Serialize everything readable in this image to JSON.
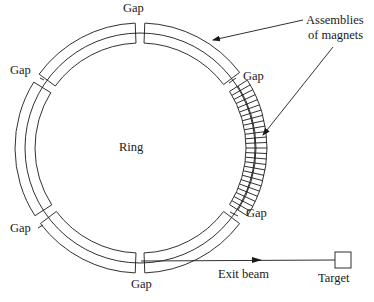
{
  "diagram": {
    "ring_label": "Ring",
    "gap_labels": [
      "Gap",
      "Gap",
      "Gap",
      "Gap",
      "Gap",
      "Gap"
    ],
    "assemblies_label_line1": "Assemblies",
    "assemblies_label_line2": "of magnets",
    "exit_beam_label": "Exit beam",
    "target_label": "Target",
    "colors": {
      "line": "#1a1a1a",
      "background": "#ffffff"
    },
    "geometry": {
      "center": [
        140,
        148
      ],
      "r_outer": 125,
      "r_mid": 115,
      "r_inner": 105,
      "gap_angles_deg": [
        -90,
        -35,
        35,
        90,
        145,
        -146
      ],
      "magnet_arc_deg": [
        -32,
        32
      ],
      "magnet_segments": 26
    }
  }
}
